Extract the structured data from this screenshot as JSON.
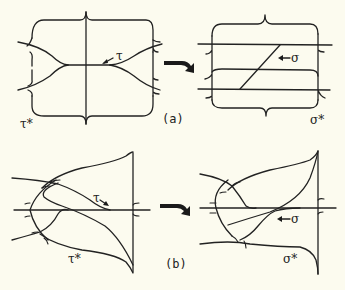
{
  "figure": {
    "panels": [
      {
        "id": "a",
        "caption": "(a)",
        "left": {
          "curve_label": "τ",
          "surface_label": "τ*"
        },
        "right": {
          "curve_label": "σ",
          "surface_label": "σ*"
        }
      },
      {
        "id": "b",
        "caption": "(b)",
        "left": {
          "curve_label": "τ",
          "surface_label": "τ*"
        },
        "right": {
          "curve_label": "σ",
          "surface_label": "σ*"
        }
      }
    ],
    "colors": {
      "background": "#fcfbef",
      "ink": "#222222"
    }
  }
}
